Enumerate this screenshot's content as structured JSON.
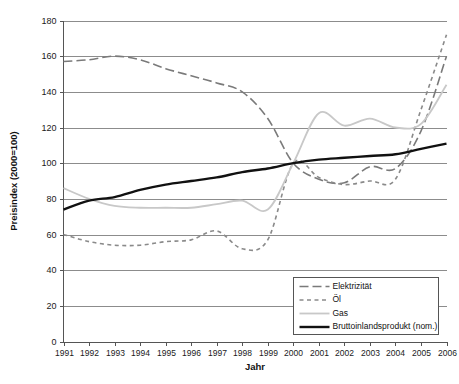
{
  "chart_data": {
    "type": "line",
    "title": "",
    "xlabel": "Jahr",
    "ylabel": "Preisindex (2000=100)",
    "xlim": [
      1991,
      2006
    ],
    "ylim": [
      0,
      180
    ],
    "ytick_step": 20,
    "grid": true,
    "legend_position": "bottom-right",
    "x": [
      1991,
      1992,
      1993,
      1994,
      1995,
      1996,
      1997,
      1998,
      1999,
      2000,
      2001,
      2002,
      2003,
      2004,
      2005,
      2006
    ],
    "xtick_labels": [
      "1991",
      "1992",
      "1993",
      "1994",
      "1995",
      "1996",
      "1997",
      "1998",
      "1999",
      "2000",
      "2001",
      "2002",
      "2003",
      "2004",
      "2005",
      "2006"
    ],
    "ytick_labels": [
      "0",
      "20",
      "40",
      "60",
      "80",
      "100",
      "120",
      "140",
      "160",
      "180"
    ],
    "series": [
      {
        "name": "Elektrizität",
        "color": "#7a7a7a",
        "style": "long-dash",
        "width": 1.6,
        "values": [
          157,
          158,
          160,
          158,
          153,
          149,
          145,
          140,
          125,
          100,
          91,
          89,
          98,
          97,
          118,
          160
        ]
      },
      {
        "name": "Öl",
        "color": "#8a8a8a",
        "style": "short-dash",
        "width": 1.6,
        "values": [
          60,
          56,
          54,
          54,
          56,
          57,
          62,
          52,
          57,
          100,
          92,
          88,
          90,
          91,
          130,
          172
        ]
      },
      {
        "name": "Gas",
        "color": "#c8c8c8",
        "style": "solid",
        "width": 1.8,
        "values": [
          86,
          80,
          76,
          75,
          75,
          75,
          77,
          79,
          74,
          100,
          128,
          121,
          125,
          120,
          122,
          144
        ]
      },
      {
        "name": "Bruttoinlandsprodukt (nom.)",
        "color": "#111111",
        "style": "solid-thick",
        "width": 2.4,
        "values": [
          74,
          79,
          81,
          85,
          88,
          90,
          92,
          95,
          97,
          100,
          102,
          103,
          104,
          105,
          108,
          111
        ]
      }
    ],
    "legend_entries": [
      {
        "label": "Elektrizität",
        "color": "#7a7a7a",
        "style": "long-dash",
        "width": 1.6
      },
      {
        "label": "Öl",
        "color": "#8a8a8a",
        "style": "short-dash",
        "width": 1.6
      },
      {
        "label": "Gas",
        "color": "#c8c8c8",
        "style": "solid",
        "width": 1.8
      },
      {
        "label": "Bruttoinlandsprodukt (nom.)",
        "color": "#111111",
        "style": "solid-thick",
        "width": 2.4
      }
    ]
  }
}
